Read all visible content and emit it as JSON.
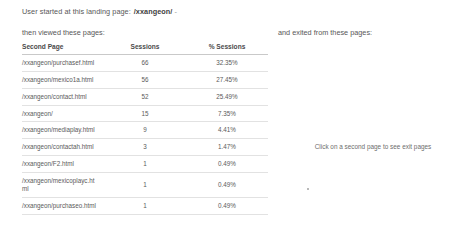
{
  "left": {
    "landing_label": "User started at this landing page:",
    "landing_path": "/xxangeon/",
    "landing_trailing": "-",
    "then_viewed_label": "then viewed these pages:"
  },
  "right": {
    "exited_label": "and exited from these pages:",
    "exit_hint": "Click on a second page to see exit pages"
  },
  "table": {
    "headers": {
      "page": "Second Page",
      "sessions": "Sessions",
      "percent": "% Sessions"
    },
    "rows": [
      {
        "page": "/xxangeon/purchasef.html",
        "sessions": "66",
        "percent": "32.35%"
      },
      {
        "page": "/xxangeon/mexico1a.html",
        "sessions": "56",
        "percent": "27.45%"
      },
      {
        "page": "/xxangeon/contact.html",
        "sessions": "52",
        "percent": "25.49%"
      },
      {
        "page": "/xxangeon/",
        "sessions": "15",
        "percent": "7.35%"
      },
      {
        "page": "/xxangeon/mediaplay.html",
        "sessions": "9",
        "percent": "4.41%"
      },
      {
        "page": "/xxangeon/contactah.html",
        "sessions": "3",
        "percent": "1.47%"
      },
      {
        "page": "/xxangeon/F2.html",
        "sessions": "1",
        "percent": "0.49%"
      },
      {
        "page": "/xxangeon/mexicoplayc.html",
        "sessions": "1",
        "percent": "0.49%"
      },
      {
        "page": "/xxangeon/purchaseo.html",
        "sessions": "1",
        "percent": "0.49%"
      }
    ]
  }
}
